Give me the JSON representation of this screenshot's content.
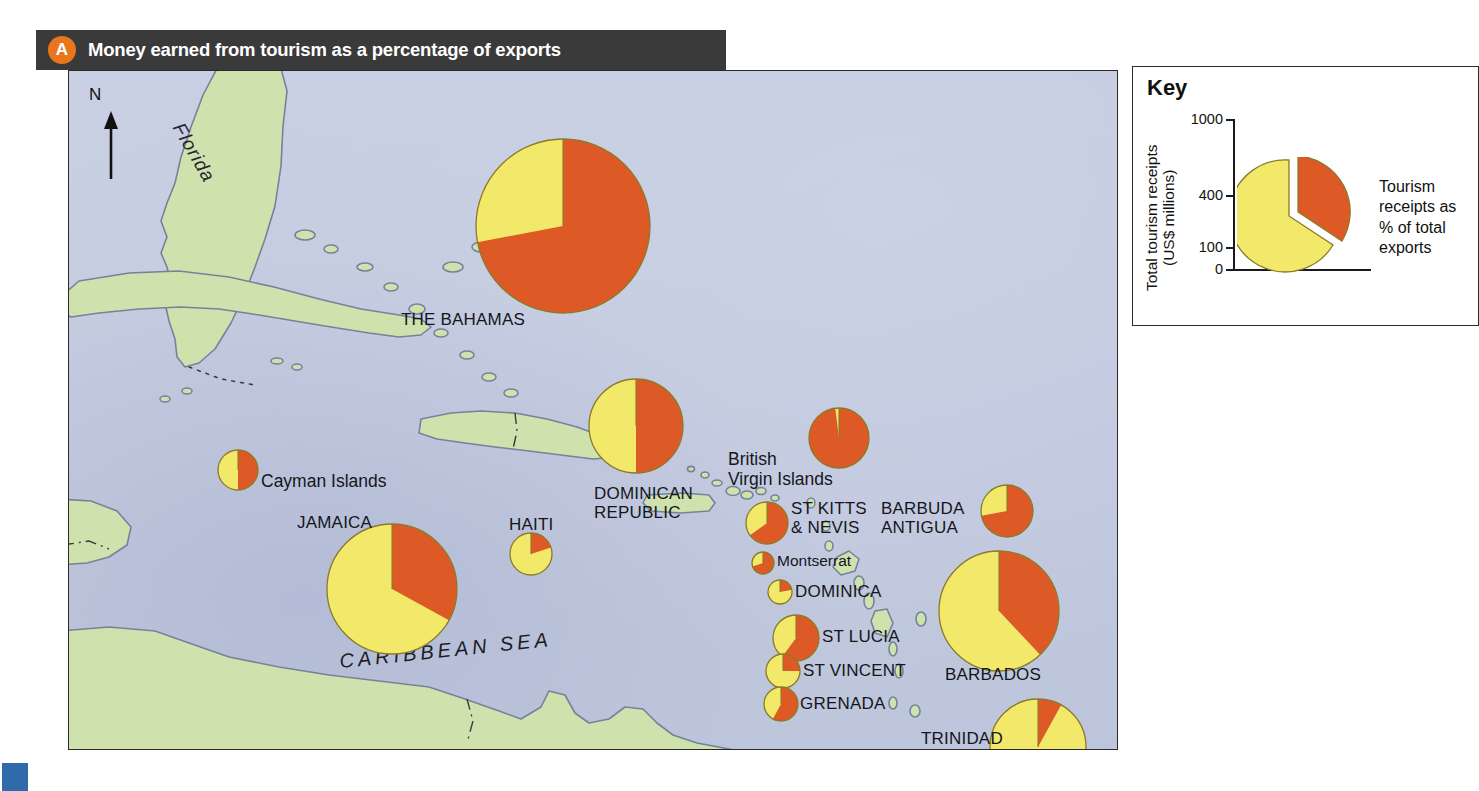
{
  "figure": {
    "badge": "A",
    "title": "Money earned from tourism as a percentage of exports"
  },
  "key": {
    "title": "Key",
    "axis_label_line1": "Total tourism receipts",
    "axis_label_line2": "(US$ millions)",
    "tick_labels": [
      "1000",
      "400",
      "100",
      "0"
    ],
    "slice_caption": "Tourism\nreceipts as\n% of total\nexports",
    "colors": {
      "tourism_percent": "#DD5A26",
      "other_exports": "#F2E86A"
    }
  },
  "map": {
    "north_arrow_label": "N",
    "sea_label": "CARIBBEAN SEA",
    "region_label": "Florida",
    "colors": {
      "sea": "#C6CDE1",
      "land": "#CFE2AD",
      "coastline": "#6b7a8f",
      "pie_red": "#DD5A26",
      "pie_yellow": "#F2E86A",
      "pie_outline": "#8a7a2a"
    }
  },
  "chart_data": {
    "type": "pie",
    "title": "Money earned from tourism as a percentage of exports",
    "unit_radius": "Total tourism receipts (US$ millions)",
    "slice_meaning": [
      "Tourism receipts as % of total exports",
      "Remainder of exports"
    ],
    "places": [
      {
        "name": "THE BAHAMAS",
        "label": "THE BAHAMAS",
        "red_pct": 72,
        "r": 87,
        "cx": 494,
        "cy": 155,
        "lx": 332,
        "ly": 239,
        "align": "left",
        "case": "caps"
      },
      {
        "name": "DOMINICAN REPUBLIC",
        "label": "DOMINICAN\nREPUBLIC",
        "red_pct": 50,
        "r": 47,
        "cx": 567,
        "cy": 355,
        "lx": 525,
        "ly": 413,
        "align": "left",
        "case": "caps"
      },
      {
        "name": "HAITI",
        "label": "HAITI",
        "red_pct": 20,
        "r": 21,
        "cx": 462,
        "cy": 483,
        "lx": 440,
        "ly": 444,
        "align": "left",
        "case": "caps"
      },
      {
        "name": "JAMAICA",
        "label": "JAMAICA",
        "red_pct": 33,
        "r": 65,
        "cx": 323,
        "cy": 518,
        "lx": 228,
        "ly": 442,
        "align": "left",
        "case": "caps"
      },
      {
        "name": "Cayman Islands",
        "label": "Cayman Islands",
        "red_pct": 50,
        "r": 20,
        "cx": 169,
        "cy": 399,
        "lx": 192,
        "ly": 401,
        "align": "left",
        "case": "mixed"
      },
      {
        "name": "British Virgin Islands",
        "label": "British\nVirgin Islands",
        "red_pct": 98,
        "r": 30,
        "cx": 770,
        "cy": 367,
        "lx": 659,
        "ly": 379,
        "align": "left",
        "case": "mixed"
      },
      {
        "name": "ST KITTS & NEVIS",
        "label": "ST KITTS\n& NEVIS",
        "red_pct": 65,
        "r": 21,
        "cx": 698,
        "cy": 452,
        "lx": 722,
        "ly": 428,
        "align": "left",
        "case": "caps"
      },
      {
        "name": "BARBUDA ANTIGUA",
        "label": "BARBUDA\nANTIGUA",
        "red_pct": 72,
        "r": 26,
        "cx": 938,
        "cy": 440,
        "lx": 812,
        "ly": 428,
        "align": "left",
        "case": "caps"
      },
      {
        "name": "Montserrat",
        "label": "Montserrat",
        "red_pct": 70,
        "r": 11,
        "cx": 694,
        "cy": 492,
        "lx": 708,
        "ly": 481,
        "align": "left",
        "case": "mixed"
      },
      {
        "name": "DOMINICA",
        "label": "DOMINICA",
        "red_pct": 22,
        "r": 12,
        "cx": 711,
        "cy": 521,
        "lx": 726,
        "ly": 511,
        "align": "left",
        "case": "caps"
      },
      {
        "name": "ST LUCIA",
        "label": "ST LUCIA",
        "red_pct": 60,
        "r": 23,
        "cx": 727,
        "cy": 567,
        "lx": 753,
        "ly": 556,
        "align": "left",
        "case": "caps"
      },
      {
        "name": "ST VINCENT",
        "label": "ST VINCENT",
        "red_pct": 25,
        "r": 17,
        "cx": 714,
        "cy": 600,
        "lx": 734,
        "ly": 590,
        "align": "left",
        "case": "caps"
      },
      {
        "name": "GRENADA",
        "label": "GRENADA",
        "red_pct": 58,
        "r": 17,
        "cx": 712,
        "cy": 633,
        "lx": 731,
        "ly": 623,
        "align": "left",
        "case": "caps"
      },
      {
        "name": "BARBADOS",
        "label": "BARBADOS",
        "red_pct": 38,
        "r": 60,
        "cx": 930,
        "cy": 540,
        "lx": 876,
        "ly": 594,
        "align": "left",
        "case": "caps"
      },
      {
        "name": "TRINIDAD & TOBAGO",
        "label": "TRINIDAD\n& TOBAGO",
        "red_pct": 8,
        "r": 48,
        "cx": 969,
        "cy": 676,
        "lx": 852,
        "ly": 658,
        "align": "left",
        "case": "caps"
      }
    ]
  }
}
